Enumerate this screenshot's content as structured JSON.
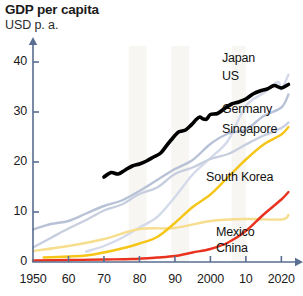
{
  "chart_data": {
    "type": "line",
    "title": "GDP per capita",
    "subtitle": "USD p. a.",
    "xlabel": "",
    "ylabel": "USD p. a.",
    "xlim": [
      1950,
      2023
    ],
    "ylim": [
      0,
      42
    ],
    "grid": false,
    "legend_position": "right-inline",
    "y_ticks": [
      "0",
      "10",
      "20",
      "30",
      "40"
    ],
    "y_tick_values": [
      0,
      10,
      20,
      30,
      40
    ],
    "x_ticks": [
      "1950",
      "60",
      "70",
      "80",
      "90",
      "2000",
      "10",
      "2020"
    ],
    "x_tick_values": [
      1950,
      1960,
      1970,
      1980,
      1990,
      2000,
      2010,
      2020
    ],
    "colors": {
      "japan": "#000000",
      "us": "#b8c2d6",
      "germany": "#c7cfdf",
      "singapore": "#d4daea",
      "south_korea": "#f5c518",
      "mexico": "#f7dd8e",
      "china": "#e8321e",
      "axis": "#5a6e91",
      "band": "#f7f6f2"
    },
    "series": [
      {
        "name": "Japan",
        "color": "#000000",
        "highlighted": true,
        "label_x": 222,
        "label_y": 51,
        "x": [
          1970,
          1972,
          1974,
          1976,
          1978,
          1980,
          1982,
          1984,
          1986,
          1988,
          1990,
          1991,
          1992,
          1993,
          1994,
          1995,
          1996,
          1997,
          1998,
          1999,
          2000,
          2002,
          2004,
          2006,
          2008,
          2010,
          2012,
          2014,
          2016,
          2018,
          2020,
          2022
        ],
        "values": [
          17.0,
          17.9,
          17.6,
          18.4,
          19.2,
          19.6,
          20.2,
          21.0,
          21.8,
          23.6,
          25.3,
          26.0,
          26.2,
          26.4,
          27.0,
          27.7,
          28.5,
          29.0,
          28.6,
          28.6,
          29.5,
          29.7,
          30.7,
          31.6,
          32.0,
          32.6,
          33.6,
          34.2,
          34.6,
          35.3,
          34.8,
          35.5
        ]
      },
      {
        "name": "US",
        "color": "#b8c2d6",
        "highlighted": false,
        "label_x": 222,
        "label_y": 69,
        "x": [
          1950,
          1955,
          1960,
          1965,
          1970,
          1975,
          1980,
          1985,
          1990,
          1995,
          2000,
          2005,
          2010,
          2015,
          2020,
          2022
        ],
        "values": [
          6.5,
          7.6,
          8.2,
          9.7,
          11.2,
          12.3,
          14.2,
          16.4,
          18.6,
          20.4,
          23.6,
          25.7,
          26.5,
          29.2,
          30.9,
          33.5
        ]
      },
      {
        "name": "Germany",
        "color": "#c7cfdf",
        "highlighted": false,
        "label_x": 222,
        "label_y": 102,
        "x": [
          1950,
          1955,
          1960,
          1965,
          1970,
          1975,
          1980,
          1985,
          1990,
          1995,
          2000,
          2005,
          2010,
          2015,
          2020,
          2022
        ],
        "values": [
          2.9,
          4.8,
          6.7,
          8.4,
          10.3,
          11.5,
          13.6,
          14.9,
          17.6,
          18.9,
          20.6,
          21.6,
          23.5,
          25.3,
          26.8,
          27.9
        ]
      },
      {
        "name": "Singapore",
        "color": "#d4daea",
        "highlighted": false,
        "label_x": 222,
        "label_y": 122,
        "x": [
          1965,
          1970,
          1975,
          1980,
          1985,
          1990,
          1995,
          2000,
          2005,
          2010,
          2015,
          2019,
          2020,
          2022
        ],
        "values": [
          2.1,
          3.2,
          4.8,
          6.9,
          9.0,
          13.0,
          17.5,
          20.8,
          24.3,
          31.2,
          33.8,
          36.0,
          34.5,
          37.5
        ]
      },
      {
        "name": "South Korea",
        "color": "#f5c518",
        "highlighted": false,
        "label_x": 206,
        "label_y": 170,
        "x": [
          1953,
          1960,
          1965,
          1970,
          1975,
          1980,
          1985,
          1990,
          1995,
          2000,
          2005,
          2010,
          2015,
          2020,
          2022
        ],
        "values": [
          0.9,
          1.1,
          1.3,
          1.9,
          2.7,
          3.7,
          5.0,
          7.8,
          11.0,
          13.5,
          17.0,
          20.5,
          23.5,
          25.5,
          27.0
        ]
      },
      {
        "name": "Mexico",
        "color": "#f7dd8e",
        "highlighted": false,
        "label_x": 216,
        "label_y": 225,
        "x": [
          1950,
          1960,
          1970,
          1980,
          1990,
          2000,
          2010,
          2020,
          2022
        ],
        "values": [
          2.2,
          3.2,
          4.6,
          6.6,
          6.8,
          8.2,
          8.6,
          8.5,
          9.4
        ]
      },
      {
        "name": "China",
        "color": "#e8321e",
        "highlighted": false,
        "label_x": 216,
        "label_y": 241,
        "x": [
          1950,
          1960,
          1970,
          1978,
          1985,
          1990,
          1995,
          2000,
          2005,
          2010,
          2015,
          2020,
          2022
        ],
        "values": [
          0.3,
          0.4,
          0.5,
          0.6,
          0.9,
          1.2,
          1.9,
          2.6,
          3.9,
          6.2,
          9.5,
          12.5,
          14.0
        ]
      }
    ],
    "bands": [
      {
        "x_start": 1977,
        "x_end": 1982
      },
      {
        "x_start": 1989,
        "x_end": 1994
      },
      {
        "x_start": 2006,
        "x_end": 2010
      }
    ]
  }
}
